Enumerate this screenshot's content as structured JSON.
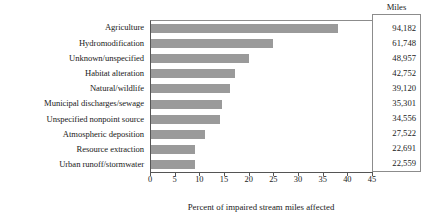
{
  "chart_data": {
    "type": "bar",
    "orientation": "horizontal",
    "title": "",
    "xlabel": "Percent of impaired stream miles affected",
    "ylabel": "",
    "xlim": [
      0,
      45
    ],
    "xticks": [
      0,
      5,
      10,
      15,
      20,
      25,
      30,
      35,
      40,
      45
    ],
    "xtick_labels": [
      "0",
      "5",
      "10",
      "15",
      "20",
      "25",
      "30",
      "35",
      "40",
      "45"
    ],
    "grid": false,
    "legend": null,
    "bar_color": "#9a9a9a",
    "categories": [
      "Agriculture",
      "Hydromodification",
      "Unknown/unspecified",
      "Habitat alteration",
      "Natural/wildlife",
      "Municipal discharges/sewage",
      "Unspecified nonpoint source",
      "Atmospheric deposition",
      "Resource extraction",
      "Urban runoff/stormwater"
    ],
    "values": [
      38.0,
      24.7,
      19.9,
      17.0,
      16.0,
      14.3,
      14.0,
      11.0,
      8.9,
      8.9
    ],
    "side_table": {
      "header": "Miles",
      "values": [
        "94,182",
        "61,748",
        "48,957",
        "42,752",
        "39,120",
        "35,301",
        "34,556",
        "27,522",
        "22,691",
        "22,559"
      ]
    }
  }
}
